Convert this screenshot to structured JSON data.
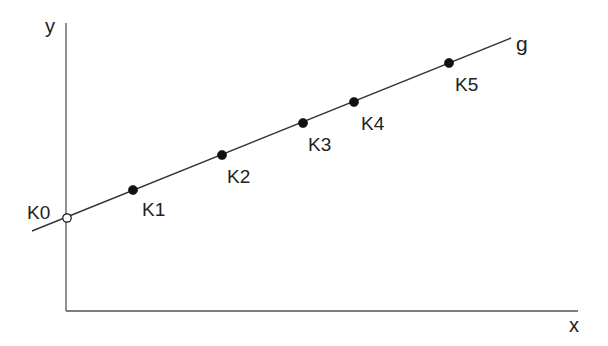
{
  "diagram": {
    "colors": {
      "background": "#ffffff",
      "axis": "#555555",
      "line": "#333333",
      "point_fill": "#111111",
      "origin_point_fill": "#ffffff",
      "text": "#222222"
    },
    "axes": {
      "x_label": "x",
      "y_label": "y",
      "origin": [
        66,
        311
      ],
      "x_end": [
        578,
        311
      ],
      "y_end": [
        66,
        23
      ]
    },
    "line": {
      "label": "g",
      "start": [
        32,
        231
      ],
      "end": [
        511,
        38
      ]
    },
    "points": [
      {
        "label": "K0",
        "x": 67,
        "y": 218,
        "style": "open",
        "label_pos": [
          27,
          203
        ]
      },
      {
        "label": "K1",
        "x": 133,
        "y": 190,
        "style": "filled",
        "label_pos": [
          142,
          200
        ]
      },
      {
        "label": "K2",
        "x": 222,
        "y": 155,
        "style": "filled",
        "label_pos": [
          227,
          167
        ]
      },
      {
        "label": "K3",
        "x": 303,
        "y": 123,
        "style": "filled",
        "label_pos": [
          308,
          135
        ]
      },
      {
        "label": "K4",
        "x": 354,
        "y": 102,
        "style": "filled",
        "label_pos": [
          361,
          114
        ]
      },
      {
        "label": "K5",
        "x": 449,
        "y": 63,
        "style": "filled",
        "label_pos": [
          455,
          75
        ]
      }
    ]
  }
}
